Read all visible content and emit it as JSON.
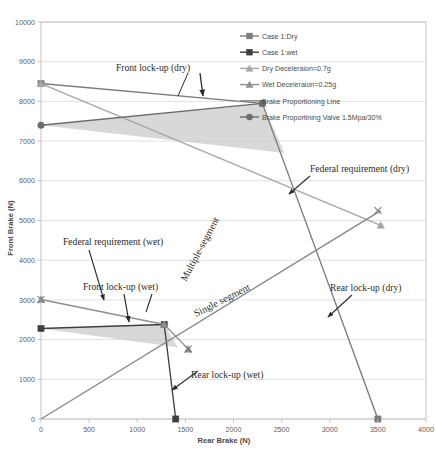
{
  "chart_data": {
    "type": "line",
    "title": "",
    "xlabel": "Rear Brake (N)",
    "ylabel": "Front Brake (N)",
    "xlim": [
      0,
      4000
    ],
    "ylim": [
      0,
      10000
    ],
    "xticks": [
      "0",
      "500",
      "1000",
      "1500",
      "2000",
      "2500",
      "3000",
      "3500",
      "4000"
    ],
    "yticks": [
      "0",
      "1000",
      "2000",
      "3000",
      "4000",
      "5000",
      "6000",
      "7000",
      "8000",
      "9000",
      "10000"
    ],
    "grid": "horizontal",
    "legend_position": "top-right",
    "series": [
      {
        "name": "Case 1:Dry",
        "marker": "square",
        "color": "#7b7b7b",
        "points": [
          [
            0,
            8450
          ],
          [
            2300,
            7950
          ],
          [
            3500,
            0
          ]
        ]
      },
      {
        "name": "Case 1:wet",
        "marker": "square",
        "color": "#3f3f3f",
        "points": [
          [
            0,
            2280
          ],
          [
            1280,
            2380
          ],
          [
            1400,
            0
          ]
        ]
      },
      {
        "name": "Dry Deceleraion=0.7g",
        "marker": "triangle",
        "color": "#a6a6a6",
        "points": [
          [
            0,
            8450
          ],
          [
            3530,
            4880
          ]
        ]
      },
      {
        "name": "Wet Deceleraion=0.25g",
        "marker": "triangle",
        "color": "#8f8f8f",
        "points": [
          [
            0,
            3010
          ],
          [
            1280,
            2380
          ],
          [
            1530,
            1760
          ]
        ]
      },
      {
        "name": "Brake Proportioning Line",
        "marker": "none",
        "color": "#878787",
        "points": [
          [
            0,
            0
          ],
          [
            3530,
            5250
          ]
        ]
      },
      {
        "name": "Brake Proportining Valve 1.5Mpa/30%",
        "marker": "circle",
        "color": "#6b6b6b",
        "points": [
          [
            0,
            7400
          ],
          [
            2300,
            7950
          ]
        ]
      }
    ],
    "shaded_regions": [
      {
        "name": "dry-operating-region",
        "color": "#c9c9c9",
        "polygon": [
          [
            0,
            7400
          ],
          [
            2300,
            7950
          ],
          [
            2530,
            6700
          ]
        ]
      },
      {
        "name": "wet-operating-region",
        "color": "#c9c9c9",
        "polygon": [
          [
            0,
            2280
          ],
          [
            1280,
            2380
          ],
          [
            1420,
            1810
          ]
        ]
      }
    ],
    "annotations": [
      {
        "id": "front-lockup-dry",
        "text": "Front lock-up (dry)"
      },
      {
        "id": "federal-requirement-dry",
        "text": "Federal requirement (dry)"
      },
      {
        "id": "federal-requirement-wet",
        "text": "Federal requirement (wet)"
      },
      {
        "id": "front-lockup-wet",
        "text": "Front lock-up (wet)"
      },
      {
        "id": "rear-lockup-dry",
        "text": "Rear lock-up (dry)"
      },
      {
        "id": "rear-lockup-wet",
        "text": "Rear lock-up (wet)"
      },
      {
        "id": "multiple-segment",
        "text": "Multiple-segment"
      },
      {
        "id": "single-segment",
        "text": "Single segment"
      }
    ]
  },
  "legend": {
    "items": [
      {
        "label": "Case 1:Dry"
      },
      {
        "label": "Case 1:wet"
      },
      {
        "label": "Dry Deceleraion=0.7g"
      },
      {
        "label": "Wet Deceleraion=0.25g"
      },
      {
        "label": "Brake Proportioning Line"
      },
      {
        "label": "Brake Proportining Valve 1.5Mpa/30%"
      }
    ]
  },
  "axes": {
    "x_title": "Rear Brake (N)",
    "y_title": "Front Brake (N)",
    "x_ticks": [
      "0",
      "500",
      "1000",
      "1500",
      "2000",
      "2500",
      "3000",
      "3500",
      "4000"
    ],
    "y_ticks": [
      "0",
      "1000",
      "2000",
      "3000",
      "4000",
      "5000",
      "6000",
      "7000",
      "8000",
      "9000",
      "10000"
    ]
  },
  "annotations": {
    "front_lockup_dry": "Front lock-up (dry)",
    "federal_requirement_dry": "Federal requirement (dry)",
    "federal_requirement_wet": "Federal requirement (wet)",
    "front_lockup_wet": "Front lock-up (wet)",
    "rear_lockup_dry": "Rear lock-up (dry)",
    "rear_lockup_wet": "Rear lock-up (wet)",
    "multiple_segment": "Multiple-segment",
    "single_segment": "Single segment"
  }
}
